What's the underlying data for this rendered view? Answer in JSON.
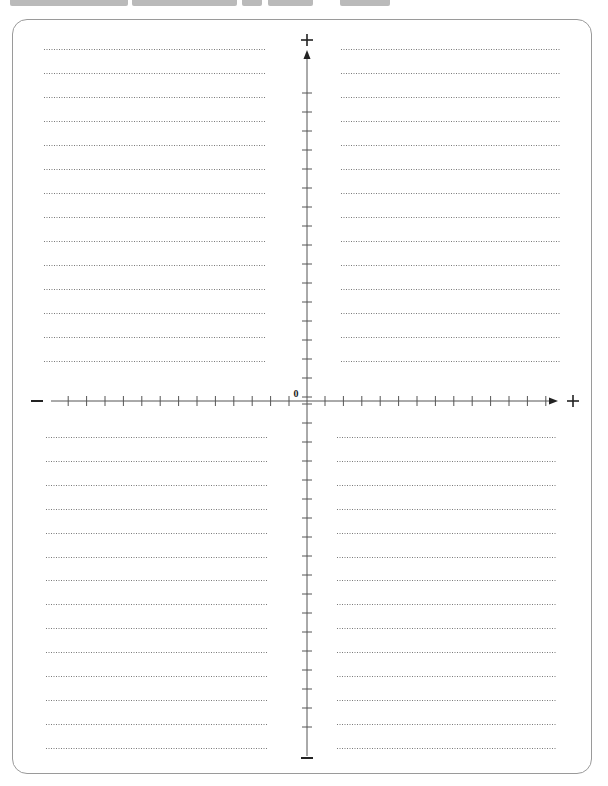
{
  "worksheet": {
    "header_text_clipped": true,
    "axes": {
      "origin_label": "0",
      "x_positive_label": "+",
      "x_negative_label": "−",
      "y_positive_label": "+",
      "y_negative_label": "−",
      "origin": {
        "x": 307,
        "y": 401
      },
      "x_axis": {
        "start": 51,
        "end": 558,
        "tick_spacing": 18.4,
        "ticks_left": 13,
        "ticks_right": 13
      },
      "y_axis": {
        "start": 50,
        "end": 756,
        "tick_spacing": 19,
        "ticks_up": 17,
        "ticks_down": 18
      },
      "color": "#555555"
    },
    "writing_lines": {
      "upper_left": {
        "x1": 44,
        "x2": 266,
        "y_start": 49,
        "count": 14,
        "spacing": 24
      },
      "upper_right": {
        "x1": 341,
        "x2": 561,
        "y_start": 49,
        "count": 14,
        "spacing": 24
      },
      "lower_left": {
        "x1": 46,
        "x2": 268,
        "y_start": 437,
        "count": 14,
        "spacing": 23.9
      },
      "lower_right": {
        "x1": 337,
        "x2": 556,
        "y_start": 437,
        "count": 14,
        "spacing": 23.9
      },
      "color": "#7a7a7a"
    },
    "frame": {
      "border_color": "#9a9a9a",
      "radius": 15
    }
  }
}
